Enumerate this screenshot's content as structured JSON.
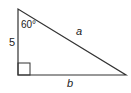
{
  "diagram": {
    "type": "right-triangle",
    "stroke_color": "#333333",
    "labels": {
      "angle": "60°",
      "vertical_side": "5",
      "hypotenuse": "a",
      "base": "b"
    },
    "vertices": {
      "top": [
        18,
        9
      ],
      "right_angle": [
        18,
        75
      ],
      "right": [
        126,
        75
      ]
    }
  }
}
